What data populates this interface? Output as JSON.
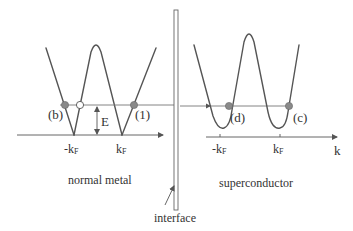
{
  "diagram": {
    "regions": {
      "left": "normal metal",
      "right": "superconductor",
      "interface": "interface"
    },
    "left_panel": {
      "points": {
        "b": "(b)",
        "one": "(1)"
      },
      "energy_label": "E",
      "ticks": {
        "neg_kf": "-kF",
        "pos_kf": "kF"
      }
    },
    "right_panel": {
      "points": {
        "d": "(d)",
        "c": "(c)"
      },
      "ticks": {
        "neg_kf": "-kF",
        "pos_kf": "kF"
      },
      "axis_label": "k"
    },
    "colors": {
      "line": "#555555",
      "filled_dot": "#8a8a8a",
      "open_dot": "#ffffff",
      "text": "#333333"
    }
  }
}
